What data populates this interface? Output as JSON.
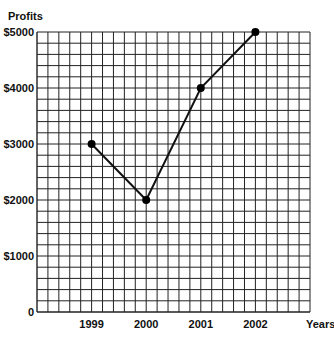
{
  "chart_data": {
    "type": "line",
    "title": "",
    "xlabel": "Years",
    "ylabel": "Profits",
    "categories": [
      "1999",
      "2000",
      "2001",
      "2002"
    ],
    "values": [
      3000,
      2000,
      4000,
      5000
    ],
    "y_ticks": [
      "0",
      "$1000",
      "$2000",
      "$3000",
      "$4000",
      "$5000"
    ],
    "ylim": [
      0,
      5000
    ],
    "grid": true,
    "legend": "none",
    "colors": {
      "line": "#111111",
      "grid": "#222222",
      "marker": "#000000"
    }
  }
}
